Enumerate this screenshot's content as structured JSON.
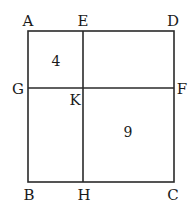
{
  "diagram": {
    "type": "geometry-square-partition",
    "stroke_color": "#2a2a2a",
    "outer_square": {
      "vertices": [
        "A",
        "B",
        "C",
        "D"
      ],
      "x1": 28,
      "y1": 31,
      "x2": 174,
      "y2": 182
    },
    "vertical_line": {
      "from": "E",
      "to": "H",
      "x": 83
    },
    "horizontal_line": {
      "from": "G",
      "to": "F",
      "y": 88
    },
    "intersection": "K",
    "points": {
      "A": {
        "label": "A",
        "x": 28,
        "y": 24
      },
      "E": {
        "label": "E",
        "x": 83,
        "y": 24
      },
      "D": {
        "label": "D",
        "x": 173,
        "y": 24
      },
      "G": {
        "label": "G",
        "x": 18,
        "y": 93
      },
      "F": {
        "label": "F",
        "x": 181,
        "y": 93
      },
      "K": {
        "label": "K",
        "x": 75,
        "y": 104
      },
      "B": {
        "label": "B",
        "x": 29,
        "y": 199
      },
      "H": {
        "label": "H",
        "x": 84,
        "y": 199
      },
      "C": {
        "label": "C",
        "x": 173,
        "y": 199
      }
    },
    "regions": [
      {
        "name": "AEKG",
        "value": "4",
        "x": 56,
        "y": 66
      },
      {
        "name": "KFCH",
        "value": "9",
        "x": 128,
        "y": 137
      }
    ]
  }
}
